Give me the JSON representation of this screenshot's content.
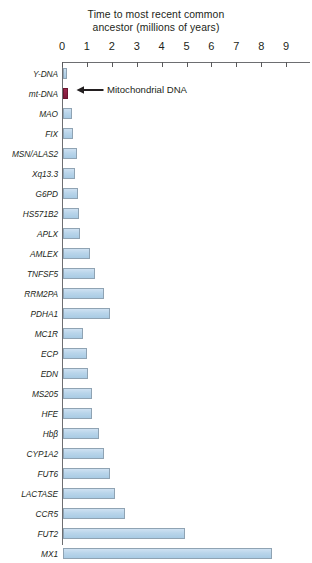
{
  "chart_data": {
    "type": "bar",
    "orientation": "horizontal",
    "title": "Time to most recent common ancestor (millions of years)",
    "title_line1": "Time to most recent common",
    "title_line2": "ancestor (millions of years)",
    "xlabel": "",
    "ylabel": "",
    "xlim": [
      0,
      9.6
    ],
    "xticks": [
      0,
      1,
      2,
      3,
      4,
      5,
      6,
      7,
      8,
      9
    ],
    "xtick_labels": [
      "0",
      "1",
      "2",
      "3",
      "4",
      "5",
      "6",
      "7",
      "8",
      "9"
    ],
    "grid": false,
    "legend": "none",
    "bar_color": "#b9d5ea",
    "bar_border_color": "#8fa3b3",
    "highlight_color": "#8a1f42",
    "categories": [
      "Y-DNA",
      "mt-DNA",
      "MAO",
      "FIX",
      "MSN/ALAS2",
      "Xq13.3",
      "G6PD",
      "HS571B2",
      "APLX",
      "AMLEX",
      "TNFSF5",
      "RRM2PA",
      "PDHA1",
      "MC1R",
      "ECP",
      "EDN",
      "MS205",
      "HFE",
      "Hbβ",
      "CYP1A2",
      "FUT6",
      "LACTASE",
      "CCR5",
      "FUT2",
      "MX1"
    ],
    "values": [
      0.15,
      0.2,
      0.37,
      0.4,
      0.57,
      0.5,
      0.6,
      0.65,
      0.68,
      1.1,
      1.3,
      1.65,
      1.9,
      0.8,
      0.95,
      1.0,
      1.15,
      1.15,
      1.45,
      1.65,
      1.9,
      2.1,
      2.5,
      4.9,
      8.4
    ],
    "highlight_category": "mt-DNA",
    "annotations": [
      {
        "text": "Mitochondrial DNA",
        "target": "mt-DNA",
        "icon": "left-arrow-icon"
      }
    ]
  }
}
